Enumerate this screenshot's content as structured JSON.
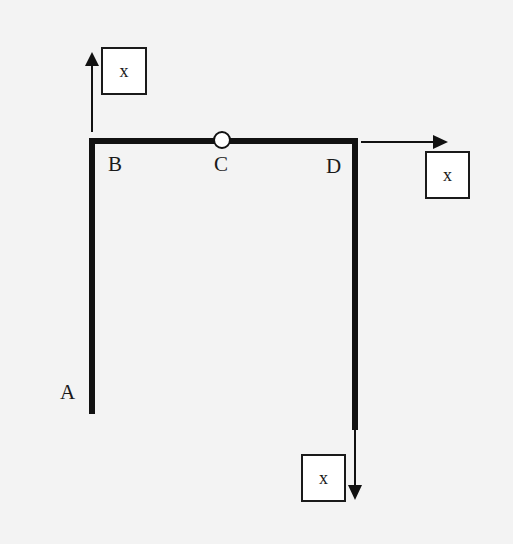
{
  "diagram": {
    "type": "frame structure with hinge and applied loads",
    "points": {
      "A": "A",
      "B": "B",
      "C": "C",
      "D": "D"
    },
    "loads": {
      "top_left": "x",
      "right": "x",
      "bottom": "x"
    },
    "colors": {
      "background": "#f3f3f3",
      "member": "#111111",
      "box_fill": "#ffffff"
    }
  }
}
